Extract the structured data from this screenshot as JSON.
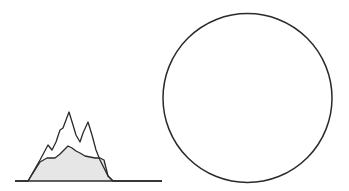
{
  "figure": {
    "width": 349,
    "height": 191,
    "background": "#ffffff",
    "stroke_color": "#2a2a2a",
    "fill_color": "#e6e6e6"
  },
  "profile_graph": {
    "baseline": {
      "x1": 15,
      "x2": 162,
      "y": 181
    },
    "outer_profile_points": "15,181 28,181 40,160 48,145 52,150 56,142 60,130 63,128 69,112 73,125 76,135 80,142 83,133 88,122 92,135 96,150 100,160 104,168 108,176 113,181 162,181",
    "inner_profile_points": "28,181 40,162 47,158 55,158 60,154 64,150 68,146 72,148 76,151 80,153 85,156 90,157 95,158 100,158 104,160 108,176 113,181"
  },
  "circle": {
    "cx": 247.5,
    "cy": 98,
    "r": 84.5
  }
}
